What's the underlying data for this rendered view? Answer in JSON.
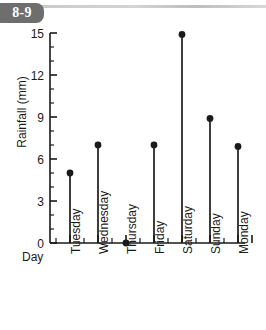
{
  "badge": {
    "label": "8-9"
  },
  "chart_data": {
    "type": "bar",
    "title": "",
    "subtitle": "",
    "xlabel": "Day",
    "ylabel": "Rainfall (mm)",
    "categories": [
      "Tuesday",
      "Wednesday",
      "Thursday",
      "Friday",
      "Saturday",
      "Sunday",
      "Monday"
    ],
    "values": [
      5,
      7,
      0,
      7,
      14.9,
      8.9,
      6.9
    ],
    "ylim": [
      0,
      15
    ],
    "ytick_labels": [
      "0",
      "3",
      "6",
      "9",
      "12",
      "15"
    ],
    "ytick_values": [
      0,
      3,
      6,
      9,
      12,
      15
    ],
    "yminor_step": 1,
    "grid": false,
    "legend": false,
    "legend_position": "none",
    "marker": "filled-circle",
    "series_color": "#1a1a1a",
    "note": "Lollipop / stem plot: thin vertical stem with filled circle marker at each day value."
  },
  "colors": {
    "axis": "#1a1a1a",
    "marker": "#1a1a1a",
    "badge_bg": "#6e6e6e",
    "badge_text": "#ffffff",
    "rule": "#cfcfcf",
    "background": "#ffffff"
  }
}
